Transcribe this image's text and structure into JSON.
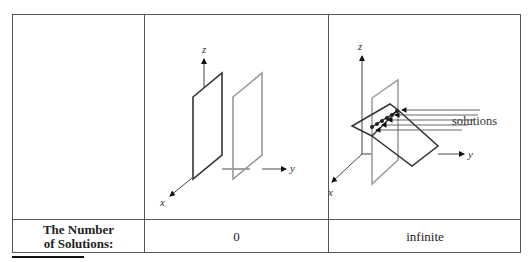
{
  "table": {
    "row_label": "The Number\nof Solutions:",
    "row_label_line1": "The Number",
    "row_label_line2": "of Solutions:",
    "columns": [
      {
        "figure": "two parallel planes",
        "axes": {
          "x": "x",
          "y": "y",
          "z": "z"
        },
        "value": "0"
      },
      {
        "figure": "two intersecting planes with solutions along line of intersection",
        "axes": {
          "x": "x",
          "y": "y",
          "z": "z"
        },
        "annotation": "solutions",
        "value": "infinite"
      }
    ]
  }
}
